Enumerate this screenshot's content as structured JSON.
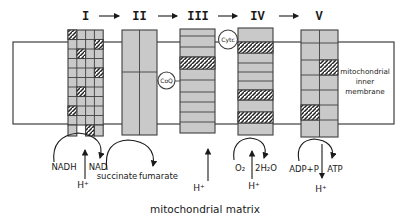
{
  "colors": {
    "complex_fill": "#c9c9c9",
    "line": "#3f3f3f",
    "ink": "#1a1a1a",
    "background": "#ffffff"
  },
  "chain": {
    "complex_labels": [
      "I",
      "II",
      "III",
      "IV",
      "V"
    ],
    "carriers": {
      "coq": "CoQ",
      "cytc": "Cytc"
    }
  },
  "membrane_label": {
    "line1": "mitochondrial",
    "line2": "inner",
    "line3": "membrane"
  },
  "matrix_label": "mitochondrial matrix",
  "reactions": {
    "complex1": {
      "in": "NADH",
      "out": "NAD",
      "proton": "H⁺"
    },
    "complex2": {
      "in": "succinate",
      "out": "fumarate"
    },
    "complex3": {
      "proton": "H⁺"
    },
    "complex4": {
      "in": "O₂",
      "out": "2H₂O",
      "proton": "H⁺"
    },
    "complex5": {
      "in": "ADP+P",
      "out": "ATP",
      "proton": "H⁺"
    }
  }
}
